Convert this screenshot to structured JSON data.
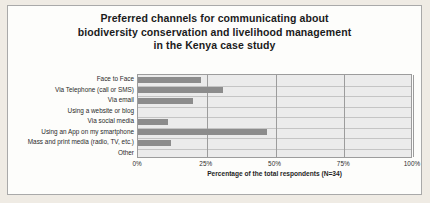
{
  "chart_data": {
    "type": "bar",
    "orientation": "horizontal",
    "title": "Preferred channels for communicating about biodiversity conservation and livelihood management in the Kenya case study",
    "title_lines": [
      "Preferred channels for communicating about",
      "biodiversity conservation and livelihood management",
      "in the Kenya case study"
    ],
    "categories": [
      "Face to Face",
      "Via Telephone (call or SMS)",
      "Via email",
      "Using a website or blog",
      "Via social media",
      "Using an App on my smartphone",
      "Mass and print media (radio, TV, etc.)",
      "Other"
    ],
    "values": [
      23,
      31,
      20,
      0,
      11,
      47,
      12,
      0
    ],
    "xlabel": "Percentage of the total respondents (N=34)",
    "ylabel": "",
    "xlim": [
      0,
      100
    ],
    "xticks": [
      0,
      25,
      50,
      75,
      100
    ],
    "xtick_labels": [
      "0%",
      "25%",
      "50%",
      "75%",
      "100%"
    ],
    "grid": "vertical-and-horizontal",
    "legend": "none",
    "bar_color": "#8c8c8c",
    "plot_background": "#ebebeb"
  }
}
